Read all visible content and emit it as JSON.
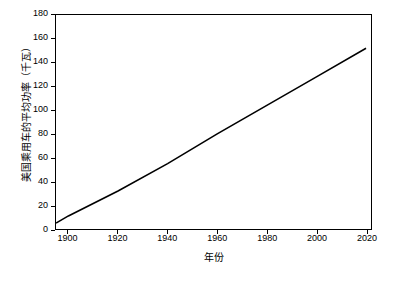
{
  "chart_data": {
    "type": "line",
    "title": "",
    "xlabel": "年份",
    "ylabel": "美国乘用车的平均功率（千瓦）",
    "xlim": [
      1895,
      2022
    ],
    "ylim": [
      0,
      180
    ],
    "xticks": [
      1900,
      1920,
      1940,
      1960,
      1980,
      2000,
      2020
    ],
    "yticks": [
      0,
      20,
      40,
      60,
      80,
      100,
      120,
      140,
      160,
      180
    ],
    "grid": false,
    "legend": "none",
    "series": [
      {
        "name": "美国乘用车的平均功率",
        "x": [
          1895,
          1900,
          1920,
          1940,
          1960,
          1980,
          2000,
          2020
        ],
        "y": [
          5,
          11,
          32,
          55,
          80,
          104,
          128,
          152
        ]
      }
    ]
  }
}
